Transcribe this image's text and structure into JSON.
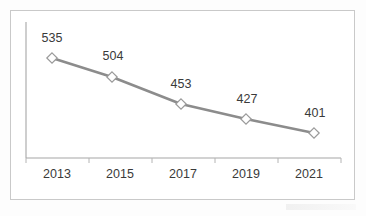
{
  "chart_data": {
    "type": "line",
    "title": "",
    "subtitle": "",
    "xlabel": "",
    "ylabel": "",
    "categories": [
      "2013",
      "2015",
      "2017",
      "2019",
      "2021"
    ],
    "values": [
      535,
      504,
      453,
      427,
      401
    ],
    "data_labels": [
      "535",
      "504",
      "453",
      "427",
      "401"
    ],
    "tick_labels": [
      "2013",
      "2015",
      "2017",
      "2019",
      "2021"
    ],
    "legend": [],
    "legend_position": "none",
    "grid": false,
    "ylim": [
      380,
      560
    ],
    "series": [
      {
        "name": "",
        "values": [
          535,
          504,
          453,
          427,
          401
        ]
      }
    ],
    "marker": "diamond-hollow",
    "annotations": []
  },
  "style": {
    "line_color": "#8c8c8c",
    "marker_fill": "#ffffff",
    "marker_stroke": "#9a9a9a",
    "axis_color": "#a6a6a6",
    "label_color": "#3a3a3a",
    "frame_color": "#c9c9c9",
    "background": "#ffffff"
  },
  "points": [
    {
      "category": "2013",
      "value": 535,
      "label": "535",
      "x": 52,
      "y": 58,
      "label_x": 52,
      "label_y": 42
    },
    {
      "category": "2015",
      "value": 504,
      "label": "504",
      "x": 112,
      "y": 77,
      "label_x": 113,
      "label_y": 60
    },
    {
      "category": "2017",
      "value": 453,
      "label": "453",
      "x": 181,
      "y": 104,
      "label_x": 181,
      "label_y": 88
    },
    {
      "category": "2019",
      "value": 427,
      "label": "427",
      "x": 246,
      "y": 119,
      "label_x": 247,
      "label_y": 103
    },
    {
      "category": "2021",
      "value": 401,
      "label": "401",
      "x": 314,
      "y": 133,
      "label_x": 315,
      "label_y": 117
    }
  ],
  "axis": {
    "y_axis_x": 26,
    "y_axis_top": 22,
    "y_axis_bottom": 158,
    "x_axis_left": 26,
    "x_axis_right": 341,
    "x_axis_y": 158,
    "tick_positions": [
      26,
      89,
      152,
      215,
      278,
      341
    ],
    "tick_label_positions": [
      57,
      120,
      183,
      246,
      309
    ],
    "tick_label_y": 178
  }
}
